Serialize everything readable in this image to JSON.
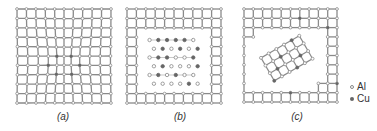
{
  "figure": {
    "panels": [
      {
        "id": "a",
        "label": "(a)",
        "description": "Coherent precipitate: lattice planes continuous but strained around cluster",
        "origin": [
          17,
          9
        ],
        "spacing": 9.4,
        "nodes": 11,
        "label_x": 63
      },
      {
        "id": "b",
        "label": "(b)",
        "description": "Semicoherent/ordered precipitate of Al and Cu atoms within matrix",
        "origin": [
          127,
          9
        ],
        "spacing": 9.4,
        "nodes": 11,
        "label_x": 180
      },
      {
        "id": "c",
        "label": "(c)",
        "description": "Incoherent precipitate: rotated lattice inside matrix",
        "origin": [
          244,
          9
        ],
        "spacing": 9.3,
        "nodes": 11,
        "label_x": 297
      }
    ],
    "legend": [
      {
        "symbol": "open-circle",
        "label": "Al"
      },
      {
        "symbol": "filled-circle",
        "label": "Cu"
      }
    ],
    "colors": {
      "line": "#8a8a8a",
      "al_fill": "#ffffff",
      "cu_fill": "#666666",
      "text": "#333333"
    }
  }
}
